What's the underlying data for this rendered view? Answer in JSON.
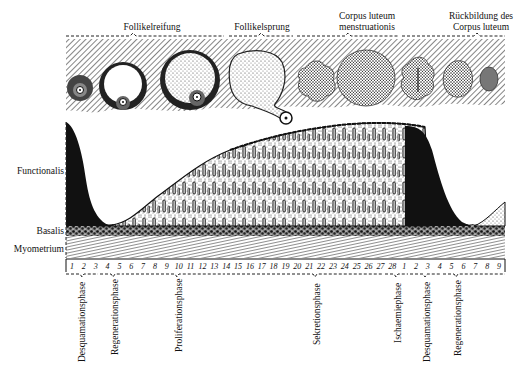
{
  "ovary_labels": [
    {
      "text": "Follikelreifung",
      "x": 107,
      "y": 22,
      "w": 90
    },
    {
      "text": "Follikelsprung",
      "x": 225,
      "y": 22,
      "w": 80
    },
    {
      "text": "Corpus luteum\nmenstruationis",
      "x": 322,
      "y": 11,
      "w": 90
    },
    {
      "text": "Rückbildung des\nCorpus luteum",
      "x": 470,
      "y": 11,
      "w": 80
    }
  ],
  "layer_labels": [
    {
      "text": "Functionalis",
      "y": 166
    },
    {
      "text": "Basalis",
      "y": 226
    },
    {
      "text": "Myometrium",
      "y": 244
    }
  ],
  "days": [
    "1",
    "2",
    "3",
    "4",
    "5",
    "6",
    "7",
    "8",
    "9",
    "10",
    "11",
    "12",
    "13",
    "14",
    "15",
    "16",
    "17",
    "18",
    "19",
    "20",
    "21",
    "22",
    "23",
    "24",
    "25",
    "26",
    "27",
    "28",
    "1",
    "2",
    "3",
    "4",
    "5",
    "6",
    "7",
    "8",
    "9"
  ],
  "phases": [
    {
      "text": "Desquamationsphase",
      "x": 80
    },
    {
      "text": "Regenerationsphase",
      "x": 113
    },
    {
      "text": "Proliferationsphase",
      "x": 177
    },
    {
      "text": "Sekretionsphase",
      "x": 315
    },
    {
      "text": "Ischaemiephase",
      "x": 396
    },
    {
      "text": "Desquamationsphase",
      "x": 425
    },
    {
      "text": "Regenerationsphase",
      "x": 456
    }
  ],
  "colors": {
    "ink": "#111111",
    "paper": "#ffffff",
    "stipple": "#bbbbbb"
  }
}
